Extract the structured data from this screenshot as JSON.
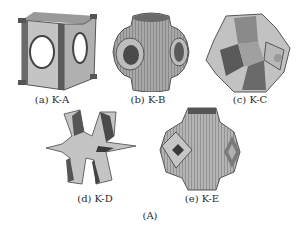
{
  "figure": {
    "caption": "(A)",
    "panels": [
      {
        "id": "a",
        "label": "(a) K-A",
        "shape": "cube-frame-with-circular-holes"
      },
      {
        "id": "b",
        "label": "(b) K-B",
        "shape": "rounded-node-with-tube-openings"
      },
      {
        "id": "c",
        "label": "(c) K-C",
        "shape": "faceted-polyhedron"
      },
      {
        "id": "d",
        "label": "(d) K-D",
        "shape": "six-armed-star"
      },
      {
        "id": "e",
        "label": "(e) K-E",
        "shape": "octahedral-node-with-dark-holes"
      }
    ]
  },
  "colors": {
    "surface": "#c8c8c8",
    "shade": "#8a8a8a",
    "dark": "#3a3a3a",
    "background": "#ffffff"
  }
}
